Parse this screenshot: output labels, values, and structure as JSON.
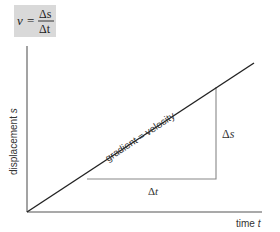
{
  "formula": {
    "lhs": "v",
    "equals": "=",
    "numerator": "Δs",
    "denominator": "Δt",
    "box_color": "#d9d9d9"
  },
  "axes": {
    "y_label": "displacement s",
    "y_label_text": "displacement ",
    "y_label_var": "s",
    "x_label_text": "time ",
    "x_label_var": "t"
  },
  "line": {
    "label": "gradient = velocity"
  },
  "triangle": {
    "delta_s": "Δs",
    "delta_t": "Δt"
  },
  "colors": {
    "axis": "#555555",
    "line": "#222222",
    "triangle": "#777777",
    "text": "#333333"
  }
}
